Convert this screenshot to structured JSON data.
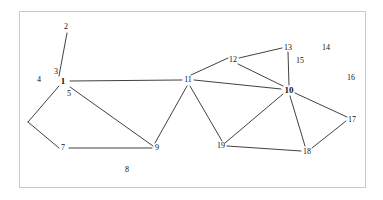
{
  "figure": {
    "background_color": "#ffffff",
    "frame_color": "#c9c9c9",
    "edge_color": "#2b2b2b",
    "label_color": "#111111"
  },
  "chart_data": {
    "type": "diagram",
    "title": "",
    "xlabel": "",
    "ylabel": "",
    "grid": false,
    "legend": "none",
    "nodes": [
      {
        "id": "2",
        "label": "2",
        "x": 66,
        "y": 27,
        "bold": false,
        "anchor_x": 66,
        "anchor_y": 33
      },
      {
        "id": "3",
        "label": "3",
        "x": 56,
        "y": 72,
        "bold": false,
        "anchor_x": 63,
        "anchor_y": 80
      },
      {
        "id": "1",
        "label": "1",
        "x": 63,
        "y": 81,
        "bold": true,
        "anchor_x": 63,
        "anchor_y": 81
      },
      {
        "id": "4",
        "label": "4",
        "x": 39,
        "y": 80,
        "bold": false,
        "anchor_x": 63,
        "anchor_y": 81
      },
      {
        "id": "5",
        "label": "5",
        "x": 69,
        "y": 94,
        "bold": false,
        "anchor_x": 69,
        "anchor_y": 88
      },
      {
        "id": "6",
        "label": "",
        "x": 28,
        "y": 122,
        "bold": false,
        "anchor_x": 28,
        "anchor_y": 122
      },
      {
        "id": "7",
        "label": "7",
        "x": 63,
        "y": 148,
        "bold": false,
        "anchor_x": 69,
        "anchor_y": 148
      },
      {
        "id": "8",
        "label": "8",
        "x": 127,
        "y": 170,
        "bold": false,
        "anchor_x": 127,
        "anchor_y": 170
      },
      {
        "id": "9",
        "label": "9",
        "x": 157,
        "y": 148,
        "bold": false,
        "anchor_x": 152,
        "anchor_y": 146
      },
      {
        "id": "11",
        "label": "11",
        "x": 188,
        "y": 80,
        "bold": false,
        "anchor_x": 194,
        "anchor_y": 80
      },
      {
        "id": "12",
        "label": "12",
        "x": 233,
        "y": 60,
        "bold": false,
        "anchor_x": 238,
        "anchor_y": 61
      },
      {
        "id": "13",
        "label": "13",
        "x": 288,
        "y": 48,
        "bold": false,
        "anchor_x": 283,
        "anchor_y": 50
      },
      {
        "id": "14",
        "label": "14",
        "x": 326,
        "y": 48,
        "bold": false,
        "anchor_x": 326,
        "anchor_y": 48
      },
      {
        "id": "15",
        "label": "15",
        "x": 300,
        "y": 61,
        "bold": false,
        "anchor_x": 294,
        "anchor_y": 61
      },
      {
        "id": "16",
        "label": "16",
        "x": 351,
        "y": 78,
        "bold": false,
        "anchor_x": 351,
        "anchor_y": 78
      },
      {
        "id": "10",
        "label": "10",
        "x": 289,
        "y": 90,
        "bold": true,
        "anchor_x": 289,
        "anchor_y": 90
      },
      {
        "id": "17",
        "label": "17",
        "x": 352,
        "y": 120,
        "bold": false,
        "anchor_x": 346,
        "anchor_y": 120
      },
      {
        "id": "18",
        "label": "18",
        "x": 307,
        "y": 152,
        "bold": false,
        "anchor_x": 307,
        "anchor_y": 148
      },
      {
        "id": "19",
        "label": "19",
        "x": 221,
        "y": 146,
        "bold": false,
        "anchor_x": 224,
        "anchor_y": 143
      }
    ],
    "edges": [
      {
        "from": "2",
        "to": "1",
        "x1": 67,
        "y1": 33,
        "x2": 59,
        "y2": 76
      },
      {
        "from": "1",
        "to": "11",
        "x1": 70,
        "y1": 81,
        "x2": 182,
        "y2": 80
      },
      {
        "from": "1",
        "to": "6",
        "x1": 59,
        "y1": 86,
        "x2": 28,
        "y2": 122
      },
      {
        "from": "1",
        "to": "9",
        "x1": 70,
        "y1": 87,
        "x2": 153,
        "y2": 146
      },
      {
        "from": "6",
        "to": "7",
        "x1": 28,
        "y1": 122,
        "x2": 59,
        "y2": 148
      },
      {
        "from": "7",
        "to": "9",
        "x1": 69,
        "y1": 148,
        "x2": 152,
        "y2": 148
      },
      {
        "from": "9",
        "to": "11",
        "x1": 155,
        "y1": 143,
        "x2": 187,
        "y2": 86
      },
      {
        "from": "11",
        "to": "12",
        "x1": 191,
        "y1": 75,
        "x2": 228,
        "y2": 58
      },
      {
        "from": "11",
        "to": "10",
        "x1": 194,
        "y1": 80,
        "x2": 281,
        "y2": 89
      },
      {
        "from": "11",
        "to": "19",
        "x1": 190,
        "y1": 86,
        "x2": 222,
        "y2": 141
      },
      {
        "from": "12",
        "to": "13",
        "x1": 239,
        "y1": 58,
        "x2": 282,
        "y2": 48
      },
      {
        "from": "12",
        "to": "10",
        "x1": 238,
        "y1": 64,
        "x2": 283,
        "y2": 86
      },
      {
        "from": "13",
        "to": "10",
        "x1": 288,
        "y1": 52,
        "x2": 289,
        "y2": 85
      },
      {
        "from": "10",
        "to": "17",
        "x1": 295,
        "y1": 93,
        "x2": 347,
        "y2": 117
      },
      {
        "from": "10",
        "to": "18",
        "x1": 290,
        "y1": 96,
        "x2": 305,
        "y2": 146
      },
      {
        "from": "10",
        "to": "19",
        "x1": 283,
        "y1": 94,
        "x2": 225,
        "y2": 143
      },
      {
        "from": "17",
        "to": "18",
        "x1": 346,
        "y1": 121,
        "x2": 312,
        "y2": 148
      },
      {
        "from": "19",
        "to": "18",
        "x1": 227,
        "y1": 146,
        "x2": 301,
        "y2": 151
      }
    ]
  }
}
